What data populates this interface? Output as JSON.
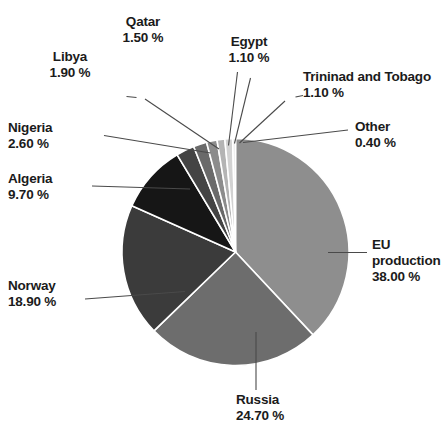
{
  "chart_data": {
    "type": "pie",
    "title": "",
    "subtitle": "",
    "xlabel": "",
    "ylabel": "",
    "legend_position": "callout-labels",
    "grid": false,
    "unit": "%",
    "total": 100.0,
    "start_angle_deg": 0,
    "direction": "clockwise",
    "categories": [
      "EU production",
      "Russia",
      "Norway",
      "Algeria",
      "Nigeria",
      "Libya",
      "Qatar",
      "Egypt",
      "Trininad and Tobago",
      "Other"
    ],
    "values": [
      38.0,
      24.7,
      18.9,
      9.7,
      2.6,
      1.9,
      1.5,
      1.1,
      1.1,
      0.4
    ],
    "slices": [
      {
        "label": "EU production",
        "value": 38.0,
        "value_text": "38.00 %",
        "color": "#8e8e8e"
      },
      {
        "label": "Russia",
        "value": 24.7,
        "value_text": "24.70 %",
        "color": "#6d6d6d"
      },
      {
        "label": "Norway",
        "value": 18.9,
        "value_text": "18.90 %",
        "color": "#3b3b3b"
      },
      {
        "label": "Algeria",
        "value": 9.7,
        "value_text": "9.70 %",
        "color": "#161616"
      },
      {
        "label": "Nigeria",
        "value": 2.6,
        "value_text": "2.60 %",
        "color": "#444444"
      },
      {
        "label": "Libya",
        "value": 1.9,
        "value_text": "1.90 %",
        "color": "#6a6a6a"
      },
      {
        "label": "Qatar",
        "value": 1.5,
        "value_text": "1.50 %",
        "color": "#8c8c8c"
      },
      {
        "label": "Egypt",
        "value": 1.1,
        "value_text": "1.10 %",
        "color": "#b4b4b4"
      },
      {
        "label": "Trininad and Tobago",
        "value": 1.1,
        "value_text": "1.10 %",
        "color": "#d2d2d2"
      },
      {
        "label": "Other",
        "value": 0.4,
        "value_text": "0.40 %",
        "color": "#e9e9e9"
      }
    ]
  },
  "labels": {
    "qatar": {
      "name": "Qatar",
      "value": "1.50 %"
    },
    "egypt": {
      "name": "Egypt",
      "value": "1.10 %"
    },
    "libya": {
      "name": "Libya",
      "value": "1.90 %"
    },
    "trinidad": {
      "name": "Trininad and Tobago",
      "value": "1.10 %"
    },
    "nigeria": {
      "name": "Nigeria",
      "value": "2.60 %"
    },
    "other": {
      "name": "Other",
      "value": "0.40 %"
    },
    "algeria": {
      "name": "Algeria",
      "value": "9.70 %"
    },
    "eu": {
      "name": "EU",
      "name2": "production",
      "value": "38.00 %"
    },
    "norway": {
      "name": "Norway",
      "value": "18.90 %"
    },
    "russia": {
      "name": "Russia",
      "value": "24.70 %"
    }
  },
  "style": {
    "background": "#ffffff",
    "text_color": "#1b1b1b",
    "leader_line_color": "#4a4a4a",
    "slice_separator_color": "#ffffff"
  }
}
